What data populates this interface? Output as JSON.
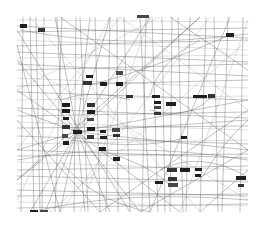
{
  "diagram": {
    "type": "network-graph",
    "background": "#ffffff",
    "edge_color": "#555555",
    "node_color": "#1e1e1e",
    "frame": {
      "x": 17,
      "y": 17,
      "width": 231,
      "height": 196
    },
    "hub_node": {
      "x": 73,
      "y": 130
    },
    "nodes": [
      {
        "x": 20,
        "y": 24,
        "w": 7,
        "h": 4
      },
      {
        "x": 38,
        "y": 28,
        "w": 7,
        "h": 4
      },
      {
        "x": 137,
        "y": 15,
        "w": 12,
        "h": 3
      },
      {
        "x": 226,
        "y": 33,
        "w": 8,
        "h": 4
      },
      {
        "x": 86,
        "y": 75,
        "w": 7,
        "h": 3
      },
      {
        "x": 83,
        "y": 81,
        "w": 9,
        "h": 4
      },
      {
        "x": 100,
        "y": 82,
        "w": 7,
        "h": 4
      },
      {
        "x": 116,
        "y": 71,
        "w": 7,
        "h": 4
      },
      {
        "x": 116,
        "y": 82,
        "w": 7,
        "h": 4
      },
      {
        "x": 126,
        "y": 95,
        "w": 7,
        "h": 3
      },
      {
        "x": 152,
        "y": 95,
        "w": 8,
        "h": 3
      },
      {
        "x": 154,
        "y": 101,
        "w": 7,
        "h": 3
      },
      {
        "x": 154,
        "y": 106,
        "w": 7,
        "h": 3
      },
      {
        "x": 154,
        "y": 112,
        "w": 7,
        "h": 3
      },
      {
        "x": 166,
        "y": 102,
        "w": 10,
        "h": 4
      },
      {
        "x": 193,
        "y": 95,
        "w": 7,
        "h": 3
      },
      {
        "x": 200,
        "y": 95,
        "w": 7,
        "h": 3
      },
      {
        "x": 208,
        "y": 94,
        "w": 7,
        "h": 4
      },
      {
        "x": 62,
        "y": 103,
        "w": 8,
        "h": 4
      },
      {
        "x": 62,
        "y": 109,
        "w": 8,
        "h": 4
      },
      {
        "x": 63,
        "y": 117,
        "w": 6,
        "h": 3
      },
      {
        "x": 62,
        "y": 125,
        "w": 8,
        "h": 4
      },
      {
        "x": 62,
        "y": 134,
        "w": 6,
        "h": 4
      },
      {
        "x": 63,
        "y": 141,
        "w": 6,
        "h": 4
      },
      {
        "x": 73,
        "y": 130,
        "w": 9,
        "h": 4
      },
      {
        "x": 87,
        "y": 103,
        "w": 8,
        "h": 4
      },
      {
        "x": 87,
        "y": 110,
        "w": 8,
        "h": 4
      },
      {
        "x": 87,
        "y": 118,
        "w": 7,
        "h": 3
      },
      {
        "x": 87,
        "y": 127,
        "w": 8,
        "h": 4
      },
      {
        "x": 87,
        "y": 135,
        "w": 7,
        "h": 4
      },
      {
        "x": 100,
        "y": 130,
        "w": 6,
        "h": 3
      },
      {
        "x": 100,
        "y": 136,
        "w": 7,
        "h": 3
      },
      {
        "x": 112,
        "y": 128,
        "w": 8,
        "h": 4
      },
      {
        "x": 113,
        "y": 134,
        "w": 7,
        "h": 3
      },
      {
        "x": 99,
        "y": 147,
        "w": 7,
        "h": 4
      },
      {
        "x": 113,
        "y": 157,
        "w": 7,
        "h": 4
      },
      {
        "x": 181,
        "y": 136,
        "w": 6,
        "h": 3
      },
      {
        "x": 167,
        "y": 168,
        "w": 10,
        "h": 4
      },
      {
        "x": 180,
        "y": 168,
        "w": 10,
        "h": 4
      },
      {
        "x": 195,
        "y": 168,
        "w": 7,
        "h": 3
      },
      {
        "x": 195,
        "y": 174,
        "w": 6,
        "h": 3
      },
      {
        "x": 168,
        "y": 177,
        "w": 9,
        "h": 4
      },
      {
        "x": 168,
        "y": 183,
        "w": 10,
        "h": 4
      },
      {
        "x": 155,
        "y": 181,
        "w": 8,
        "h": 3
      },
      {
        "x": 236,
        "y": 176,
        "w": 10,
        "h": 4
      },
      {
        "x": 238,
        "y": 184,
        "w": 6,
        "h": 3
      },
      {
        "x": 30,
        "y": 210,
        "w": 8,
        "h": 2
      },
      {
        "x": 40,
        "y": 210,
        "w": 8,
        "h": 2
      }
    ],
    "vertical_edges": [
      [
        23,
        17,
        21,
        212
      ],
      [
        30,
        17,
        34,
        212
      ],
      [
        36,
        17,
        40,
        212
      ],
      [
        44,
        17,
        42,
        212
      ],
      [
        57,
        17,
        63,
        140
      ],
      [
        62,
        17,
        55,
        212
      ],
      [
        76,
        17,
        74,
        212
      ],
      [
        80,
        17,
        88,
        212
      ],
      [
        95,
        17,
        100,
        212
      ],
      [
        110,
        17,
        106,
        212
      ],
      [
        117,
        17,
        118,
        212
      ],
      [
        124,
        17,
        130,
        212
      ],
      [
        140,
        17,
        150,
        212
      ],
      [
        146,
        17,
        142,
        212
      ],
      [
        152,
        17,
        158,
        212
      ],
      [
        162,
        17,
        165,
        212
      ],
      [
        172,
        17,
        170,
        212
      ],
      [
        178,
        17,
        183,
        212
      ],
      [
        190,
        17,
        186,
        212
      ],
      [
        206,
        17,
        200,
        212
      ],
      [
        214,
        17,
        218,
        212
      ],
      [
        228,
        17,
        222,
        212
      ],
      [
        243,
        17,
        240,
        212
      ]
    ],
    "horizontal_edges": [
      [
        17,
        20,
        248,
        22
      ],
      [
        17,
        26,
        248,
        38
      ],
      [
        17,
        32,
        248,
        28
      ],
      [
        17,
        40,
        248,
        50
      ],
      [
        17,
        46,
        248,
        40
      ],
      [
        17,
        52,
        248,
        62
      ],
      [
        17,
        58,
        248,
        55
      ],
      [
        17,
        64,
        248,
        76
      ],
      [
        17,
        70,
        248,
        64
      ],
      [
        17,
        78,
        248,
        88
      ],
      [
        17,
        86,
        248,
        80
      ],
      [
        17,
        92,
        248,
        100
      ],
      [
        17,
        100,
        248,
        96
      ],
      [
        17,
        108,
        248,
        118
      ],
      [
        17,
        116,
        248,
        112
      ],
      [
        17,
        122,
        248,
        130
      ],
      [
        17,
        128,
        248,
        126
      ],
      [
        17,
        136,
        248,
        144
      ],
      [
        17,
        144,
        248,
        140
      ],
      [
        17,
        150,
        248,
        158
      ],
      [
        17,
        156,
        248,
        154
      ],
      [
        17,
        162,
        248,
        170
      ],
      [
        17,
        170,
        248,
        166
      ],
      [
        17,
        176,
        248,
        182
      ],
      [
        17,
        184,
        248,
        180
      ],
      [
        17,
        190,
        248,
        196
      ],
      [
        17,
        196,
        248,
        194
      ],
      [
        17,
        202,
        248,
        206
      ],
      [
        17,
        208,
        248,
        204
      ]
    ],
    "diagonal_edges": [
      [
        17,
        30,
        130,
        212
      ],
      [
        30,
        17,
        200,
        212
      ],
      [
        60,
        17,
        248,
        150
      ],
      [
        17,
        90,
        160,
        17
      ],
      [
        17,
        180,
        200,
        17
      ],
      [
        50,
        212,
        248,
        40
      ],
      [
        100,
        212,
        248,
        110
      ],
      [
        17,
        150,
        120,
        17
      ],
      [
        140,
        212,
        248,
        150
      ],
      [
        17,
        60,
        248,
        200
      ],
      [
        17,
        120,
        100,
        212
      ],
      [
        120,
        17,
        248,
        110
      ],
      [
        170,
        17,
        248,
        70
      ],
      [
        17,
        200,
        110,
        17
      ],
      [
        200,
        212,
        248,
        170
      ],
      [
        60,
        212,
        210,
        17
      ],
      [
        17,
        45,
        60,
        212
      ],
      [
        150,
        17,
        80,
        212
      ],
      [
        230,
        17,
        150,
        212
      ],
      [
        248,
        20,
        180,
        212
      ]
    ],
    "hub_targets": [
      [
        17,
        60
      ],
      [
        17,
        90
      ],
      [
        17,
        110
      ],
      [
        17,
        150
      ],
      [
        17,
        180
      ],
      [
        30,
        212
      ],
      [
        45,
        212
      ],
      [
        60,
        212
      ],
      [
        85,
        212
      ],
      [
        110,
        212
      ],
      [
        140,
        212
      ],
      [
        180,
        212
      ],
      [
        248,
        150
      ],
      [
        248,
        120
      ],
      [
        248,
        100
      ],
      [
        200,
        17
      ],
      [
        150,
        17
      ],
      [
        110,
        17
      ],
      [
        90,
        17
      ],
      [
        55,
        17
      ]
    ],
    "curves": [
      "M60,100 Q95,88 130,100",
      "M150,110 Q190,120 210,98",
      "M160,170 Q200,150 246,176",
      "M20,30 Q120,50 248,34",
      "M40,210 Q130,190 248,200",
      "M100,150 Q150,165 170,185",
      "M70,140 Q140,150 185,138",
      "M90,85 Q150,70 230,35",
      "M17,160 Q130,140 248,160",
      "M200,180 Q225,140 248,120",
      "M150,95 Q160,60 200,40",
      "M60,160 Q90,200 150,212"
    ]
  }
}
